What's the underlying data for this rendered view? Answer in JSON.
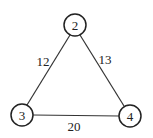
{
  "graph": {
    "nodes": [
      {
        "id": "2",
        "label": "2",
        "x": 75,
        "y": 25,
        "r": 11
      },
      {
        "id": "3",
        "label": "3",
        "x": 22,
        "y": 115,
        "r": 11
      },
      {
        "id": "4",
        "label": "4",
        "x": 130,
        "y": 116,
        "r": 11
      }
    ],
    "edges": [
      {
        "from": "2",
        "to": "3",
        "weight": "12"
      },
      {
        "from": "2",
        "to": "4",
        "weight": "13"
      },
      {
        "from": "3",
        "to": "4",
        "weight": "20"
      }
    ]
  }
}
